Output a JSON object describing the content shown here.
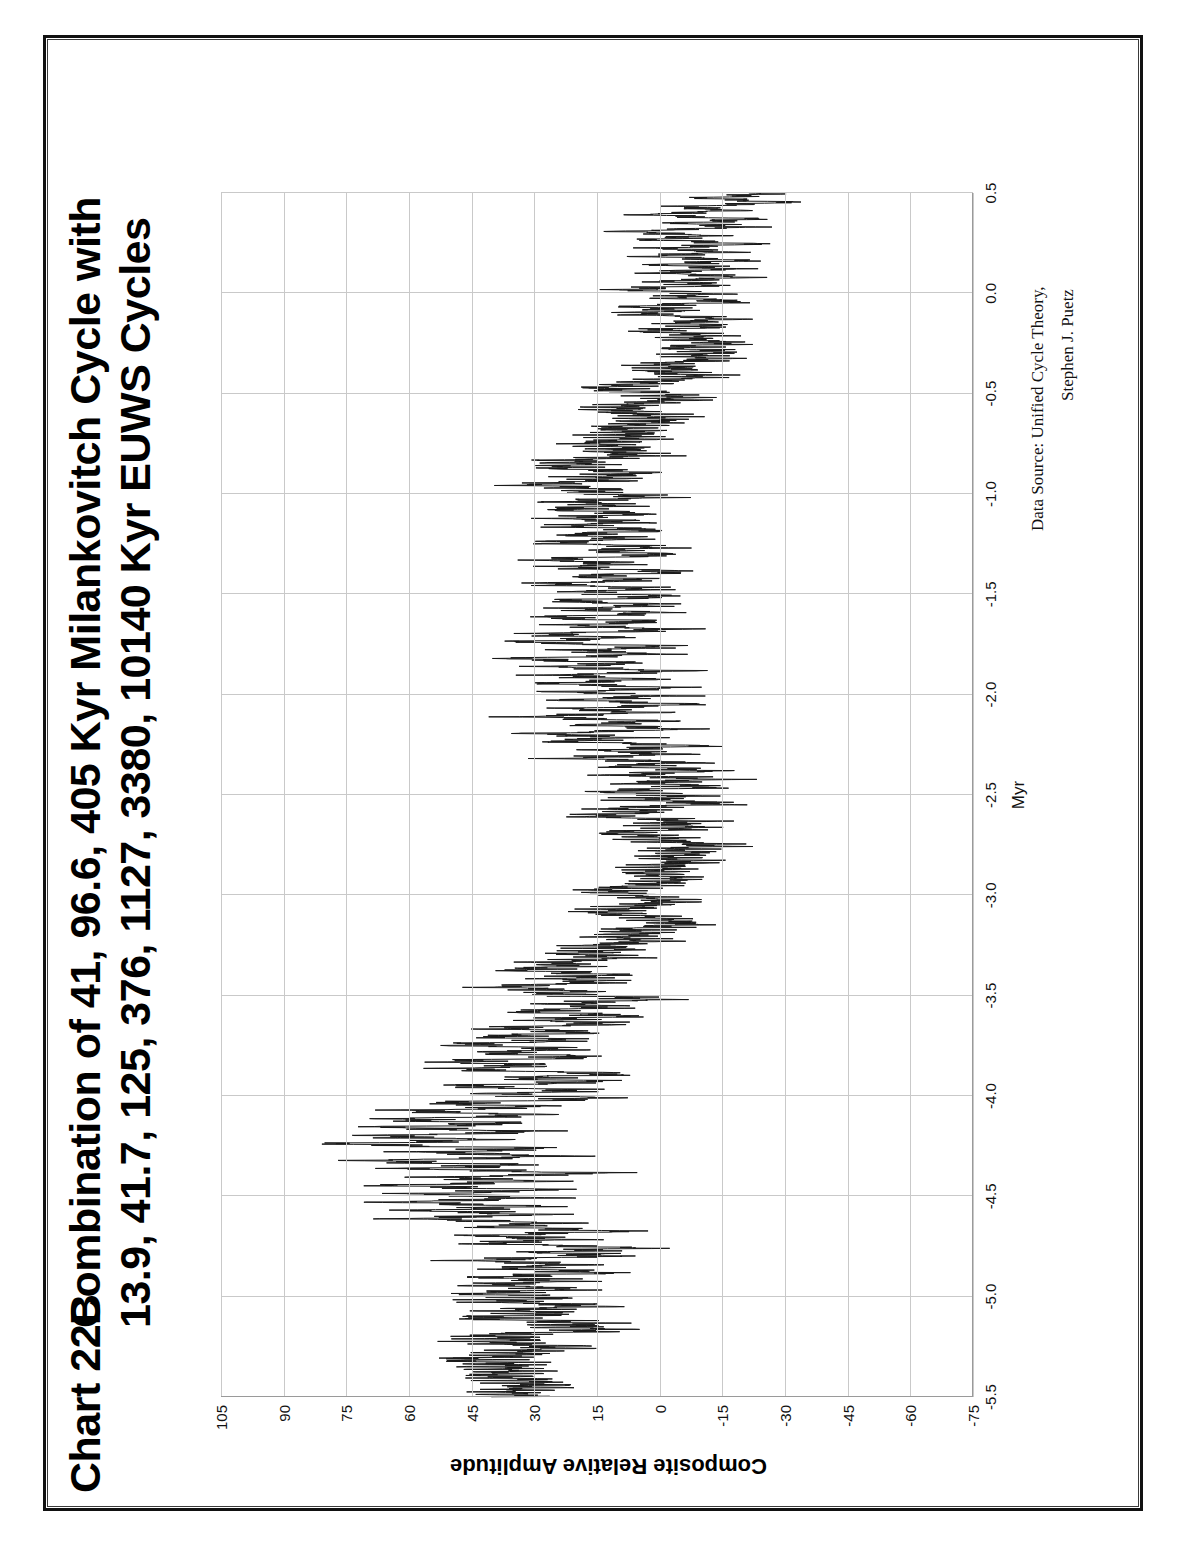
{
  "page": {
    "background": "#ffffff",
    "border_color": "#111111"
  },
  "header": {
    "chart_number": "Chart 22B",
    "title_line1": "Combination of 41, 96.6, 405 Kyr Milankovitch Cycle with",
    "title_line2": "13.9, 41.7, 125, 376, 1127, 3380, 10140 Kyr EUWS Cycles"
  },
  "source": {
    "line1": "Data Source:  Unified Cycle Theory,",
    "line2": "Stephen J. Puetz"
  },
  "chart_data": {
    "type": "line",
    "title": "Chart 22B   Combination of 41, 96.6, 405 Kyr Milankovitch Cycle with 13.9, 41.7, 125, 376, 1127, 3380, 10140 Kyr EUWS Cycles",
    "xlabel": "Myr",
    "ylabel": "Composite Relative Amplitude",
    "xlim": [
      -5.5,
      0.5
    ],
    "ylim": [
      -75,
      105
    ],
    "grid": true,
    "legend": false,
    "series_name": "Composite Relative Amplitude",
    "line_color": "#1a1a1a",
    "x_ticks": [
      -5.5,
      -5.0,
      -4.5,
      -4.0,
      -3.5,
      -3.0,
      -2.5,
      -2.0,
      -1.5,
      -1.0,
      -0.5,
      0.0,
      0.5
    ],
    "x_tick_labels": [
      "-5.5",
      "-5.0",
      "-4.5",
      "-4.0",
      "-3.5",
      "-3.0",
      "-2.5",
      "-2.0",
      "-1.5",
      "-1.0",
      "-0.5",
      "0.0",
      "0.5"
    ],
    "y_ticks": [
      -75,
      -60,
      -45,
      -30,
      -15,
      0,
      15,
      30,
      45,
      60,
      75,
      90,
      105
    ],
    "y_tick_labels": [
      "-75",
      "-60",
      "-45",
      "-30",
      "-15",
      "0",
      "15",
      "30",
      "45",
      "60",
      "75",
      "90",
      "105"
    ],
    "cycles_milankovitch_kyr": [
      41,
      96.6,
      405
    ],
    "cycles_euws_kyr": [
      13.9,
      41.7,
      125,
      376,
      1127,
      3380,
      10140
    ],
    "envelope_note": "Dense high-frequency composite; long-period envelope peaks near -4.25 Myr and troughs near -2.5 Myr and -0.3 Myr.",
    "envelope_control_points": {
      "x": [
        -5.5,
        -5.3,
        -5.1,
        -4.9,
        -4.7,
        -4.5,
        -4.3,
        -4.1,
        -3.9,
        -3.7,
        -3.5,
        -3.3,
        -3.1,
        -2.9,
        -2.7,
        -2.5,
        -2.3,
        -2.1,
        -1.9,
        -1.7,
        -1.5,
        -1.3,
        -1.1,
        -0.9,
        -0.7,
        -0.5,
        -0.3,
        -0.1,
        0.1,
        0.3,
        0.5
      ],
      "center": [
        30,
        34,
        33,
        27,
        30,
        40,
        52,
        47,
        36,
        30,
        22,
        16,
        6,
        2,
        1,
        -2,
        4,
        10,
        14,
        16,
        12,
        10,
        14,
        16,
        12,
        4,
        -6,
        -8,
        -6,
        -10,
        -14
      ],
      "half_width": [
        26,
        30,
        32,
        30,
        29,
        32,
        34,
        30,
        28,
        27,
        27,
        26,
        24,
        23,
        26,
        28,
        27,
        26,
        26,
        25,
        24,
        24,
        25,
        26,
        26,
        25,
        23,
        22,
        22,
        21,
        18
      ]
    }
  }
}
